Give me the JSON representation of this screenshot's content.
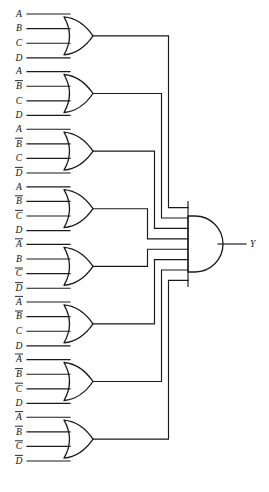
{
  "diagram": {
    "type": "logic-circuit",
    "topology": "eight 4-input OR gates feeding one 8-input AND gate",
    "output_label": "Y",
    "line_color": "#1a1a1a",
    "background_color": "#ffffff",
    "or_gate_count": 8,
    "and_gate_count": 1,
    "inputs_per_or_gate": 4
  },
  "or_gates": [
    {
      "id": "or-gate-1",
      "name": "OR1",
      "inputs": [
        {
          "var": "A",
          "inverted": false,
          "label": "A"
        },
        {
          "var": "B",
          "inverted": false,
          "label": "B"
        },
        {
          "var": "C",
          "inverted": false,
          "label": "C"
        },
        {
          "var": "D",
          "inverted": false,
          "label": "D"
        }
      ]
    },
    {
      "id": "or-gate-2",
      "name": "OR2",
      "inputs": [
        {
          "var": "A",
          "inverted": false,
          "label": "A"
        },
        {
          "var": "B",
          "inverted": true,
          "label": "B"
        },
        {
          "var": "C",
          "inverted": false,
          "label": "C"
        },
        {
          "var": "D",
          "inverted": false,
          "label": "D"
        }
      ]
    },
    {
      "id": "or-gate-3",
      "name": "OR3",
      "inputs": [
        {
          "var": "A",
          "inverted": false,
          "label": "A"
        },
        {
          "var": "B",
          "inverted": true,
          "label": "B"
        },
        {
          "var": "C",
          "inverted": false,
          "label": "C"
        },
        {
          "var": "D",
          "inverted": true,
          "label": "D"
        }
      ]
    },
    {
      "id": "or-gate-4",
      "name": "OR4",
      "inputs": [
        {
          "var": "A",
          "inverted": false,
          "label": "A"
        },
        {
          "var": "B",
          "inverted": true,
          "label": "B"
        },
        {
          "var": "C",
          "inverted": true,
          "label": "C"
        },
        {
          "var": "D",
          "inverted": false,
          "label": "D"
        }
      ]
    },
    {
      "id": "or-gate-5",
      "name": "OR5",
      "inputs": [
        {
          "var": "A",
          "inverted": true,
          "label": "A"
        },
        {
          "var": "B",
          "inverted": false,
          "label": "B"
        },
        {
          "var": "C",
          "inverted": true,
          "label": "C"
        },
        {
          "var": "D",
          "inverted": true,
          "label": "D"
        }
      ]
    },
    {
      "id": "or-gate-6",
      "name": "OR6",
      "inputs": [
        {
          "var": "A",
          "inverted": true,
          "label": "A"
        },
        {
          "var": "B",
          "inverted": true,
          "label": "B"
        },
        {
          "var": "C",
          "inverted": false,
          "label": "C"
        },
        {
          "var": "D",
          "inverted": false,
          "label": "D"
        }
      ]
    },
    {
      "id": "or-gate-7",
      "name": "OR7",
      "inputs": [
        {
          "var": "A",
          "inverted": true,
          "label": "A"
        },
        {
          "var": "B",
          "inverted": true,
          "label": "B"
        },
        {
          "var": "C",
          "inverted": true,
          "label": "C"
        },
        {
          "var": "D",
          "inverted": false,
          "label": "D"
        }
      ]
    },
    {
      "id": "or-gate-8",
      "name": "OR8",
      "inputs": [
        {
          "var": "A",
          "inverted": true,
          "label": "A"
        },
        {
          "var": "B",
          "inverted": true,
          "label": "B"
        },
        {
          "var": "C",
          "inverted": true,
          "label": "C"
        },
        {
          "var": "D",
          "inverted": true,
          "label": "D"
        }
      ]
    }
  ],
  "and_gate": {
    "id": "and-gate-output",
    "name": "AND",
    "input_count": 8,
    "output": "Y"
  }
}
